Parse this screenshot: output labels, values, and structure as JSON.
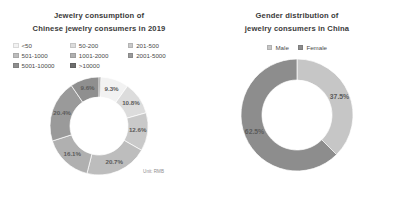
{
  "left_panel": {
    "title_lines": [
      "Jewelry consumption of",
      "Chinese jewelry consumers in 2019"
    ],
    "unit_note": "Unit: RMB",
    "legend": [
      {
        "label": "<50",
        "color": "#f2f2f2"
      },
      {
        "label": "50-200",
        "color": "#dcdcdc"
      },
      {
        "label": "201-500",
        "color": "#c9c9c9"
      },
      {
        "label": "501-1000",
        "color": "#bdbdbd"
      },
      {
        "label": "1001-2000",
        "color": "#b0b0b0"
      },
      {
        "label": "2001-5000",
        "color": "#9a9a9a"
      },
      {
        "label": "5001-10000",
        "color": "#8f8f8f"
      },
      {
        "label": ">10000",
        "color": "#6e6e6e"
      }
    ]
  },
  "right_panel": {
    "title_lines": [
      "Gender distribution of",
      "jewelry consumers in China"
    ],
    "legend": [
      {
        "label": "Male",
        "color": "#c6c6c6"
      },
      {
        "label": "Female",
        "color": "#8d8d8d"
      }
    ]
  },
  "chart_data": [
    {
      "type": "pie",
      "variant": "donut",
      "title": "Jewelry consumption of Chinese jewelry consumers in 2019",
      "unit": "Unit: RMB",
      "legend_position": "top",
      "categories": [
        "<50",
        "50-200",
        "201-500",
        "501-1000",
        "1001-2000",
        "2001-5000",
        "5001-10000",
        ">10000"
      ],
      "values": [
        9.3,
        10.8,
        12.6,
        20.7,
        16.1,
        20.4,
        9.6,
        0.5
      ],
      "data_labels": [
        "9.3%",
        "10.8%",
        "12.6%",
        "20.7%",
        "16.1%",
        "20.4%",
        "9.6%",
        ""
      ],
      "colors": [
        "#f2f2f2",
        "#dcdcdc",
        "#c9c9c9",
        "#bdbdbd",
        "#b0b0b0",
        "#9a9a9a",
        "#8f8f8f",
        "#6e6e6e"
      ]
    },
    {
      "type": "pie",
      "variant": "donut",
      "title": "Gender distribution of jewelry consumers in China",
      "legend_position": "top",
      "categories": [
        "Male",
        "Female"
      ],
      "values": [
        37.5,
        62.5
      ],
      "data_labels": [
        "37.5%",
        "62.5%"
      ],
      "colors": [
        "#c6c6c6",
        "#8d8d8d"
      ]
    }
  ]
}
